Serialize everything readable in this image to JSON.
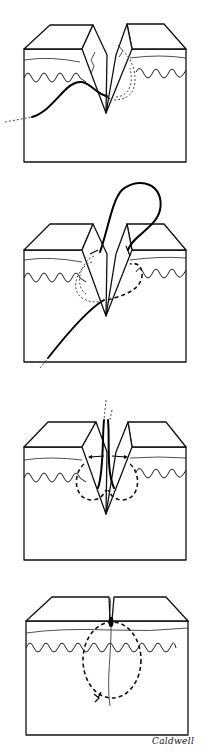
{
  "figure": {
    "panels": [
      {
        "step": 1,
        "description": "Needle passes through wound edge, suture entering from left"
      },
      {
        "step": 2,
        "description": "Suture looped across wound through both edges"
      },
      {
        "step": 3,
        "description": "Suture ends drawn upward, tension applied to approximate edges"
      },
      {
        "step": 4,
        "description": "Wound closed with buried circular suture and knot"
      }
    ],
    "signature": "Caldwell"
  },
  "colors": {
    "ink": "#111111",
    "background": "#ffffff"
  }
}
